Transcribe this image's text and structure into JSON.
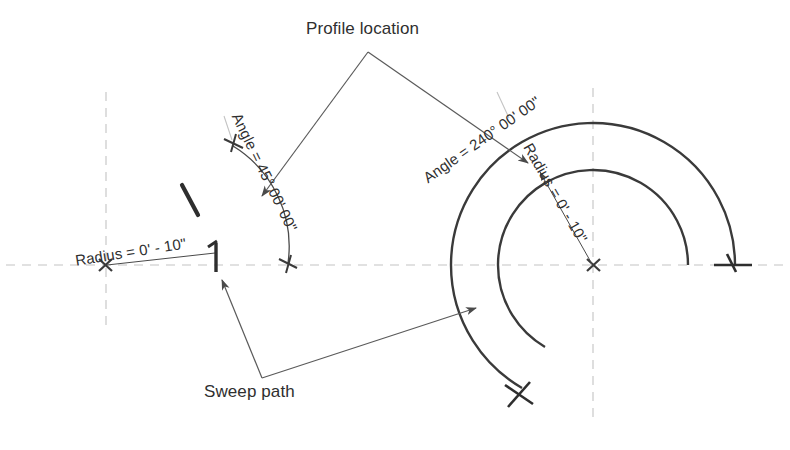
{
  "diagram": {
    "title_visible": false,
    "background": "#ffffff",
    "ink_color": "#3a3a3a",
    "centerline_color": "#bdbdbd",
    "labels": {
      "profile_location": "Profile location",
      "sweep_path": "Sweep path",
      "left_angle": "Angle = 45° 00' 00\"",
      "left_radius": "Radius = 0' - 10\"",
      "right_angle": "Angle = 240° 00' 00\"",
      "right_radius": "Radius = 0' - 10\""
    },
    "left_figure": {
      "center": [
        105,
        265
      ],
      "radius": 110,
      "sweep_angle_deg": 45,
      "radius_text": "0' - 10\"",
      "angle_text": "45° 00' 00\""
    },
    "right_figure": {
      "center": [
        593,
        265
      ],
      "outer_radius": 142,
      "inner_radius": 95,
      "sweep_angle_deg": 240,
      "radius_text": "0' - 10\"",
      "angle_text": "240° 00' 00\""
    },
    "leaders": {
      "profile_vertex": [
        368,
        52
      ],
      "sweep_vertex": [
        262,
        378
      ]
    }
  }
}
